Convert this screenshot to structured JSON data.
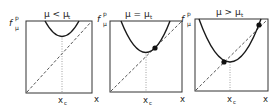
{
  "figure": {
    "y_axis_label": "f",
    "y_axis_label_sup": "p",
    "y_axis_label_sub": "μ",
    "x_axis_label": "x",
    "xc_label": "x",
    "xc_sub": "c",
    "line_color": "#1a1a1a",
    "diagonal_style": "dashed",
    "guide_style": "dotted"
  },
  "panels": [
    {
      "title": "μ < μ",
      "title_sub": "t",
      "case": "mu-less-than-mu-t",
      "fixed_points": 0
    },
    {
      "title": "μ = μ",
      "title_sub": "t",
      "case": "mu-equals-mu-t",
      "fixed_points": 1
    },
    {
      "title": "μ > μ",
      "title_sub": "t",
      "case": "mu-greater-than-mu-t",
      "fixed_points": 2
    }
  ]
}
